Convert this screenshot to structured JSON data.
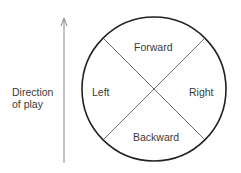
{
  "direction_label": {
    "line1": "Direction",
    "line2": "of play"
  },
  "quadrants": {
    "top": "Forward",
    "left": "Left",
    "right": "Right",
    "bottom": "Backward"
  },
  "colors": {
    "circle": "#222222",
    "lines": "#444444",
    "arrow": "#777777"
  }
}
